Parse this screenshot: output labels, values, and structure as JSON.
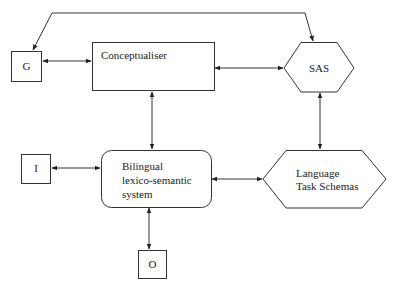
{
  "diagram": {
    "nodes": {
      "g": {
        "label": "G"
      },
      "conceptualiser": {
        "label": "Conceptualiser"
      },
      "sas": {
        "label": "SAS"
      },
      "i": {
        "label": "I"
      },
      "bilingual": {
        "line1": "Bilingual",
        "line2": "lexico-semantic",
        "line3": "system"
      },
      "lts": {
        "line1": "Language",
        "line2": "Task Schemas"
      },
      "o": {
        "label": "O"
      }
    },
    "edges": [
      {
        "from": "sas",
        "to": "g",
        "type": "one-way",
        "route": "top-loop"
      },
      {
        "from": "g",
        "to": "conceptualiser",
        "type": "bidirectional"
      },
      {
        "from": "conceptualiser",
        "to": "sas",
        "type": "bidirectional"
      },
      {
        "from": "conceptualiser",
        "to": "bilingual",
        "type": "bidirectional"
      },
      {
        "from": "sas",
        "to": "lts",
        "type": "bidirectional"
      },
      {
        "from": "i",
        "to": "bilingual",
        "type": "bidirectional"
      },
      {
        "from": "bilingual",
        "to": "lts",
        "type": "bidirectional"
      },
      {
        "from": "bilingual",
        "to": "o",
        "type": "bidirectional"
      }
    ],
    "colors": {
      "stroke": "#222222",
      "background": "#ffffff"
    }
  }
}
